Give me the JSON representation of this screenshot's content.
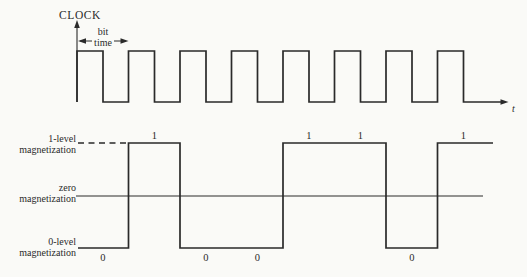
{
  "colors": {
    "paper": "#fafaf7",
    "ink": "#2a2a2a"
  },
  "clock": {
    "title": "CLOCK",
    "bit_time": {
      "line1": "bit",
      "line2": "time"
    },
    "time_axis_label": "t",
    "num_pulses": 8
  },
  "magnetization": {
    "level_labels": {
      "one": [
        "1-level",
        "magnetization"
      ],
      "zero": [
        "zero",
        "magnetization"
      ],
      "zero_level": [
        "0-level",
        "magnetization"
      ]
    },
    "bits": [
      "0",
      "1",
      "0",
      "0",
      "1",
      "1",
      "0",
      "1"
    ]
  }
}
